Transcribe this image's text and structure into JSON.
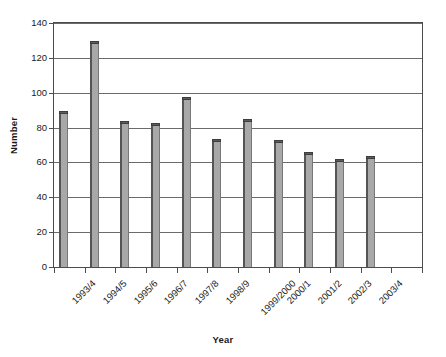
{
  "chart_data": {
    "type": "bar",
    "title": "",
    "subtitle": "",
    "xlabel": "Year",
    "ylabel": "Number",
    "categories": [
      "1993/4",
      "1994/5",
      "1995/6",
      "1996/7",
      "1997/8",
      "1998/9",
      "1999/2000",
      "2000/1",
      "2001/2",
      "2002/3",
      "2003/4"
    ],
    "values": [
      88,
      128,
      82,
      81,
      96,
      72,
      83,
      71,
      64,
      60,
      62
    ],
    "ylim": [
      0,
      140
    ],
    "ytick_labels": [
      "0",
      "20",
      "40",
      "60",
      "80",
      "100",
      "120",
      "140"
    ],
    "ytick_values": [
      0,
      20,
      40,
      60,
      80,
      100,
      120,
      140
    ],
    "ytick_step": 20,
    "grid": "horizontal",
    "legend": "none",
    "bar_fill_color": "#a8a8a8",
    "bar_edge_color": "#555555",
    "bar_cap_color": "#5c5c5c",
    "axis_color": "#4c4c4c",
    "gridline_color": "#6b6b6b",
    "background_color": "#ffffff",
    "empty_trailing_slots": 1
  }
}
